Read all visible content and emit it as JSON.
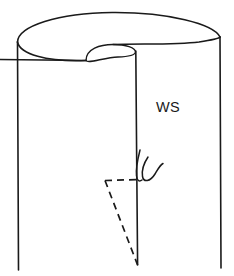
{
  "figure": {
    "kind": "line-drawing",
    "background_color": "#ffffff",
    "ink_color": "#1a1a1a"
  },
  "labels": {
    "wrong_side": "WS"
  },
  "annotations": {
    "dart": {
      "style": "dashed",
      "shape": "triangle",
      "meaning": "stitching line / dart fold to be sewn"
    },
    "threads": {
      "style": "solid-curve",
      "count": 2,
      "meaning": "loose thread tails at end of stitching"
    },
    "slit": {
      "style": "solid",
      "meaning": "cut opening in the fabric tube"
    }
  },
  "geometry": {
    "canvas": {
      "width": 234,
      "height": 276
    },
    "cylinder": {
      "left_edge_x": 17,
      "right_edge_x": 220,
      "top_left_y": 42,
      "top_right_y": 36,
      "bottom_y": 270
    },
    "top_rim_apex_y": 13,
    "slit_x": 135,
    "slit_top_y": 48,
    "slit_bottom_y": 265,
    "notch_lip": {
      "left_x": 86,
      "right_x": 135,
      "top_y": 45,
      "bottom_y": 57
    },
    "dart": {
      "apex_x": 138,
      "apex_y": 265,
      "top_left_x": 105,
      "top_left_y": 180,
      "top_right_x": 136,
      "top_right_y": 179
    },
    "ws_label_pos": {
      "x": 156,
      "y": 112
    }
  }
}
